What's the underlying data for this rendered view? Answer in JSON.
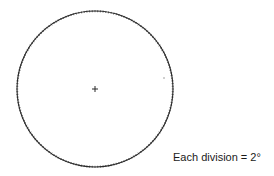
{
  "diagram": {
    "type": "graduated-circle",
    "center": {
      "x": 95,
      "y": 89
    },
    "radius": 78,
    "division_degrees": 2,
    "division_count": 180,
    "stroke_color": "#2a2a2a",
    "center_mark": "plus",
    "stray_mark": {
      "x": 164,
      "y": 78
    }
  },
  "caption": {
    "text": "Each division = 2°"
  }
}
